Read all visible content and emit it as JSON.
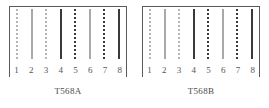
{
  "figure": {
    "colors": {
      "frame": "#5a5a5a",
      "light_solid": "#a9a9a9",
      "dark_solid": "#3a3a3a",
      "light_stripe": "#b4b4b4",
      "dark_stripe": "#3a3a3a",
      "background": "#ffffff",
      "text": "#4a4a4a"
    },
    "panels": [
      {
        "caption": "T568A",
        "pins": [
          {
            "number": "1",
            "style": "light-dotted"
          },
          {
            "number": "2",
            "style": "light-solid"
          },
          {
            "number": "3",
            "style": "light-dotted"
          },
          {
            "number": "4",
            "style": "dark-solid"
          },
          {
            "number": "5",
            "style": "dark-dotted"
          },
          {
            "number": "6",
            "style": "light-solid"
          },
          {
            "number": "7",
            "style": "dark-dotted"
          },
          {
            "number": "8",
            "style": "dark-solid"
          }
        ]
      },
      {
        "caption": "T568B",
        "pins": [
          {
            "number": "1",
            "style": "light-dotted"
          },
          {
            "number": "2",
            "style": "light-solid"
          },
          {
            "number": "3",
            "style": "light-dotted"
          },
          {
            "number": "4",
            "style": "dark-solid"
          },
          {
            "number": "5",
            "style": "dark-dotted"
          },
          {
            "number": "6",
            "style": "light-solid"
          },
          {
            "number": "7",
            "style": "dark-dotted"
          },
          {
            "number": "8",
            "style": "dark-solid"
          }
        ]
      }
    ]
  }
}
